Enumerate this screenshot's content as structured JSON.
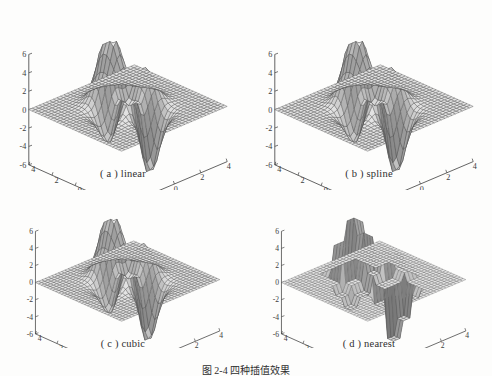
{
  "figure": {
    "caption": "图 2-4  四种插值效果",
    "background_color": "#fdfdfc",
    "line_color": "#3c3c3c"
  },
  "subplots": [
    {
      "id": "a",
      "label": "( a ) linear",
      "method": "linear",
      "surface_style": "smooth-mesh"
    },
    {
      "id": "b",
      "label": "( b ) spline",
      "method": "spline",
      "surface_style": "smooth-mesh"
    },
    {
      "id": "c",
      "label": "( c ) cubic",
      "method": "cubic",
      "surface_style": "smooth-mesh"
    },
    {
      "id": "d",
      "label": "( d ) nearest",
      "method": "nearest",
      "surface_style": "blocky-steps"
    }
  ],
  "chart_data": {
    "type": "surface",
    "title": "图 2-4  四种插值效果",
    "panels": [
      {
        "key": "a",
        "title": "( a ) linear",
        "function": "peaks",
        "interpolation": "linear",
        "xlabel": "",
        "ylabel": "",
        "zlabel": "",
        "xlim": [
          -4,
          4
        ],
        "ylim": [
          -4,
          4
        ],
        "zlim": [
          -6,
          6
        ],
        "xticks": [
          -4,
          -2,
          0,
          2,
          4
        ],
        "yticks": [
          4,
          2,
          0,
          -2,
          -4
        ],
        "zticks": [
          6,
          4,
          2,
          0,
          -2,
          -4,
          -6
        ],
        "grid": true,
        "legend": null,
        "peak_max": 6,
        "peak_min": -6
      },
      {
        "key": "b",
        "title": "( b ) spline",
        "function": "peaks",
        "interpolation": "spline",
        "xlabel": "",
        "ylabel": "",
        "zlabel": "",
        "xlim": [
          -4,
          4
        ],
        "ylim": [
          -4,
          4
        ],
        "zlim": [
          -6,
          6
        ],
        "xticks": [
          -4,
          -2,
          0,
          2,
          4
        ],
        "yticks": [
          4,
          2,
          0,
          -2,
          -4
        ],
        "zticks": [
          6,
          4,
          2,
          0,
          -2,
          -4,
          -6
        ],
        "grid": true,
        "legend": null,
        "peak_max": 6,
        "peak_min": -6
      },
      {
        "key": "c",
        "title": "( c ) cubic",
        "function": "peaks",
        "interpolation": "cubic",
        "xlabel": "",
        "ylabel": "",
        "zlabel": "",
        "xlim": [
          -4,
          4
        ],
        "ylim": [
          -4,
          4
        ],
        "zlim": [
          -6,
          6
        ],
        "xticks": [
          -4,
          -2,
          0,
          2,
          4
        ],
        "yticks": [
          4,
          2,
          0,
          -2,
          -4
        ],
        "zticks": [
          6,
          4,
          2,
          0,
          -2,
          -4,
          -6
        ],
        "grid": true,
        "legend": null,
        "peak_max": 6,
        "peak_min": -6
      },
      {
        "key": "d",
        "title": "( d ) nearest",
        "function": "peaks",
        "interpolation": "nearest",
        "xlabel": "",
        "ylabel": "",
        "zlabel": "",
        "xlim": [
          -4,
          4
        ],
        "ylim": [
          -4,
          4
        ],
        "zlim": [
          -6,
          6
        ],
        "xticks": [
          -4,
          -2,
          0,
          2,
          4
        ],
        "yticks": [
          4,
          2,
          0,
          -2,
          -4
        ],
        "zticks": [
          6,
          4,
          2,
          0,
          -2,
          -4,
          -6
        ],
        "grid": true,
        "legend": null,
        "peak_max": 6,
        "peak_min": -6
      }
    ],
    "ztick_labels": [
      "6",
      "4",
      "2",
      "0",
      "-2",
      "-4",
      "-6"
    ],
    "ytick_labels": [
      "4",
      "2",
      "0",
      "-2",
      "-4"
    ],
    "xtick_labels": [
      "-4",
      "-2",
      "0",
      "2",
      "4"
    ]
  }
}
